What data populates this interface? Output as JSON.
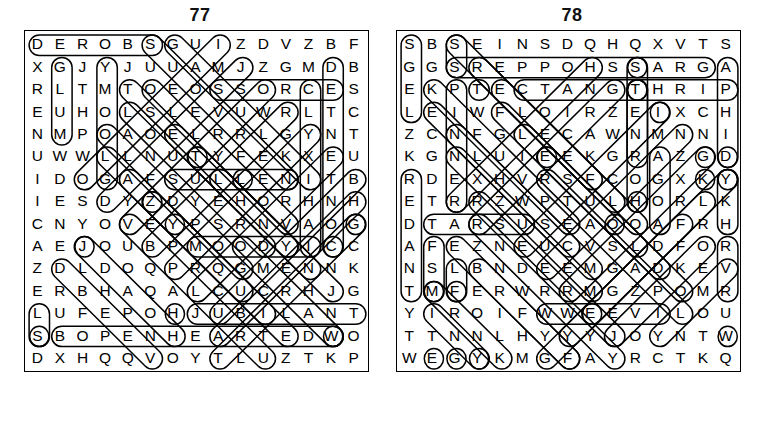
{
  "page": {
    "background_color": "#ffffff",
    "ink_color": "#000000"
  },
  "puzzles": [
    {
      "number": "77",
      "columns": 15,
      "rows": 17,
      "rows_text": [
        "D E R O B S G U I Z D V Z B F",
        "X G J Y J U U A M J Z G M D B",
        "R L T M T O E O S S O R C E S",
        "E U H O L S L E V U W R L T C",
        "N M P O A O E L R R L G Y N T",
        "U W W L L N U T Y F E K X E U",
        "I D O G A F S U L L E N I T B",
        "I E S D Y Z D Y E H O R H N H",
        "C N Y O V E Y P S R N V A O G",
        "A E J O U B P M O O D Y I C C",
        "Z D L D O Q P R Q G M E N N K",
        "E R B H A Q A L C U C R H J G",
        "L U F E P O H J U B I L A N T",
        "S B O P E N H E A R T E D W O",
        "D X H Q Q V O Y T L U Z T K P"
      ]
    },
    {
      "number": "78",
      "columns": 15,
      "rows": 17,
      "rows_text": [
        "S B S E I N S D Q H Q X V T S",
        "G G S R E P P O H S S A R G A",
        "E K P T E C T A N G T H R I P",
        "L E I W F L O I R Z E I X C H",
        "Z C N F G L E C A W N M N N I",
        "K G N L U I E E K G R A Z G D",
        "R D E X H V R S F C O G X K Y",
        "E T R R Z W P T U L H O R L K",
        "D T A R S U S E A O O A F R H",
        "A F E Z N E U C V S L D F O R",
        "N S L B N D E E M G A D K E V",
        "T M F E R W R R M G Z P O M R",
        "Y I R O I F W W E E V I L O U",
        "T T N N L H Y Y Y J O Y N T W",
        "W E G Y K M G F A Y R C T K Q"
      ]
    }
  ],
  "found_words": {
    "puzzle_77": [
      "BORED",
      "GLUM",
      "MOROSE",
      "SULLEN",
      "MOODY",
      "JUBILANT",
      "OPENHEARTED",
      "CROSS",
      "JOYOUS"
    ],
    "puzzle_78": [
      "GRASSHOPPER",
      "TRIP",
      "TARSUS",
      "WEEVIL",
      "CTENANG"
    ]
  }
}
